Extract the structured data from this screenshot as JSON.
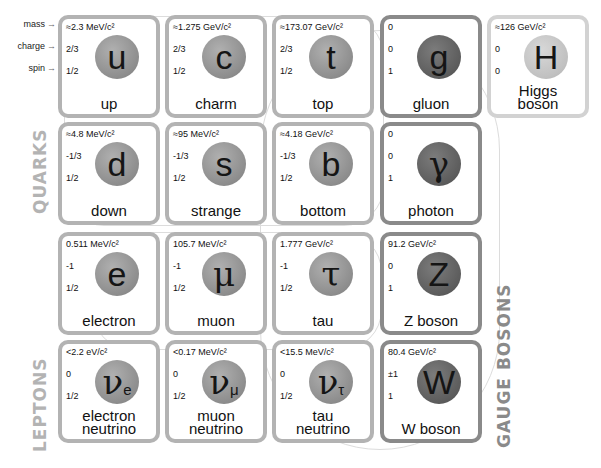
{
  "legend": {
    "mass": "mass",
    "charge": "charge",
    "spin": "spin",
    "arrow": "→"
  },
  "groups": {
    "quarks": "QUARKS",
    "leptons": "LEPTONS",
    "gauge_bosons": "GAUGE BOSONS"
  },
  "particles": {
    "up": {
      "mass": "≈2.3 MeV/c²",
      "charge": "2/3",
      "spin": "1/2",
      "symbol": "u",
      "name": "up"
    },
    "charm": {
      "mass": "≈1.275 GeV/c²",
      "charge": "2/3",
      "spin": "1/2",
      "symbol": "c",
      "name": "charm"
    },
    "top": {
      "mass": "≈173.07 GeV/c²",
      "charge": "2/3",
      "spin": "1/2",
      "symbol": "t",
      "name": "top"
    },
    "gluon": {
      "mass": "0",
      "charge": "0",
      "spin": "1",
      "symbol": "g",
      "name": "gluon"
    },
    "higgs": {
      "mass": "≈126 GeV/c²",
      "charge": "0",
      "spin": "0",
      "symbol": "H",
      "name_line1": "Higgs",
      "name_line2": "boson"
    },
    "down": {
      "mass": "≈4.8 MeV/c²",
      "charge": "-1/3",
      "spin": "1/2",
      "symbol": "d",
      "name": "down"
    },
    "strange": {
      "mass": "≈95 MeV/c²",
      "charge": "-1/3",
      "spin": "1/2",
      "symbol": "s",
      "name": "strange"
    },
    "bottom": {
      "mass": "≈4.18 GeV/c²",
      "charge": "-1/3",
      "spin": "1/2",
      "symbol": "b",
      "name": "bottom"
    },
    "photon": {
      "mass": "0",
      "charge": "0",
      "spin": "1",
      "symbol": "γ",
      "name": "photon"
    },
    "electron": {
      "mass": "0.511 MeV/c²",
      "charge": "-1",
      "spin": "1/2",
      "symbol": "e",
      "name": "electron"
    },
    "muon": {
      "mass": "105.7 MeV/c²",
      "charge": "-1",
      "spin": "1/2",
      "symbol": "μ",
      "name": "muon"
    },
    "tau": {
      "mass": "1.777 GeV/c²",
      "charge": "-1",
      "spin": "1/2",
      "symbol": "τ",
      "name": "tau"
    },
    "z": {
      "mass": "91.2 GeV/c²",
      "charge": "0",
      "spin": "1",
      "symbol": "Z",
      "name": "Z boson"
    },
    "nu_e": {
      "mass": "<2.2 eV/c²",
      "charge": "0",
      "spin": "1/2",
      "symbol": "ν",
      "sub": "e",
      "name_line1": "electron",
      "name_line2": "neutrino"
    },
    "nu_mu": {
      "mass": "<0.17 MeV/c²",
      "charge": "0",
      "spin": "1/2",
      "symbol": "ν",
      "sub": "μ",
      "name_line1": "muon",
      "name_line2": "neutrino"
    },
    "nu_tau": {
      "mass": "<15.5 MeV/c²",
      "charge": "0",
      "spin": "1/2",
      "symbol": "ν",
      "sub": "τ",
      "name_line1": "tau",
      "name_line2": "neutrino"
    },
    "w": {
      "mass": "80.4 GeV/c²",
      "charge": "±1",
      "spin": "1",
      "symbol": "W",
      "name": "W boson"
    }
  },
  "colors": {
    "fermion_border": "#b3b3b3",
    "boson_border": "#8a8a8a",
    "higgs_border": "#d2d2d2"
  }
}
